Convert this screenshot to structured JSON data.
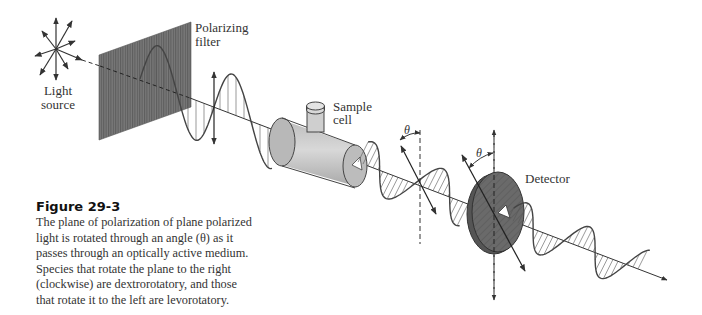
{
  "figure": {
    "number_label": "Figure 29-3",
    "caption": "The plane of polarization of plane polarized light is rotated through an angle (θ) as it passes through an optically active medium. Species that rotate the plane to the right (clockwise) are dextrorotatory, and those that rotate it to the left are levorotatory."
  },
  "labels": {
    "light_source_line1": "Light",
    "light_source_line2": "source",
    "polarizing_filter_line1": "Polarizing",
    "polarizing_filter_line2": "filter",
    "sample_cell_line1": "Sample",
    "sample_cell_line2": "cell",
    "detector": "Detector",
    "theta_1": "θ",
    "theta_2": "θ"
  },
  "colors": {
    "ink": "#333333",
    "filter_fill": "#6e6e6e",
    "cell_fill": "#c8c8c8",
    "detector_fill": "#6a6a6a"
  }
}
